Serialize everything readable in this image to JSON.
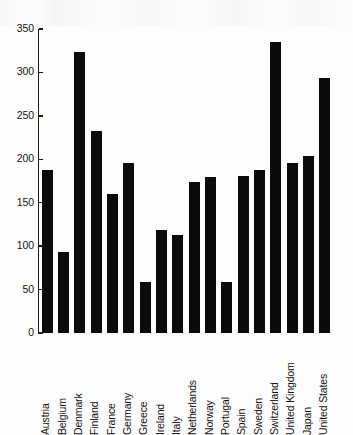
{
  "chart_data": {
    "type": "bar",
    "title": "",
    "subtitle": "",
    "xlabel": "",
    "ylabel": "",
    "ylim": [
      0,
      350
    ],
    "yticks": [
      0,
      50,
      100,
      150,
      200,
      250,
      300,
      350
    ],
    "grid": false,
    "legend": null,
    "bar_color": "#0b0b0b",
    "axis_color": "#1a1a1a",
    "background_color": "#fdfdfd",
    "categories": [
      "Austria",
      "Belgium",
      "Denmark",
      "Finland",
      "France",
      "Germany",
      "Greece",
      "Ireland",
      "Italy",
      "Netherlands",
      "Norway",
      "Portugal",
      "Spain",
      "Sweden",
      "Switzerland",
      "United Kingdom",
      "Japan",
      "United States"
    ],
    "values": [
      188,
      93,
      323,
      233,
      160,
      196,
      59,
      119,
      113,
      174,
      180,
      59,
      181,
      188,
      335,
      196,
      204,
      294
    ]
  }
}
